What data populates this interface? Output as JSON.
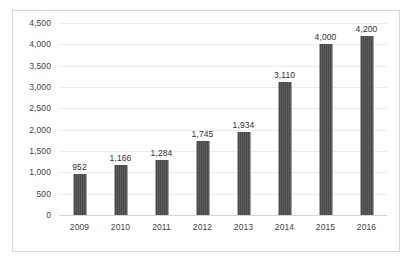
{
  "chart_data": {
    "type": "bar",
    "title": "",
    "subtitle": "",
    "xlabel": "",
    "ylabel": "",
    "categories": [
      "2009",
      "2010",
      "2011",
      "2012",
      "2013",
      "2014",
      "2015",
      "2016"
    ],
    "values": [
      952,
      1166,
      1284,
      1745,
      1934,
      3110,
      4000,
      4200
    ],
    "data_labels": [
      "952",
      "1,166",
      "1,284",
      "1,745",
      "1,934",
      "3,110",
      "4,000",
      "4,200"
    ],
    "ylim": [
      0,
      4500
    ],
    "ytick_values": [
      0,
      500,
      1000,
      1500,
      2000,
      2500,
      3000,
      3500,
      4000,
      4500
    ],
    "ytick_labels": [
      "0",
      "500",
      "1,000",
      "1,500",
      "2,000",
      "2,500",
      "3,000",
      "3,500",
      "4,000",
      "4,500"
    ],
    "grid": true,
    "grid_axis": "y",
    "legend": false,
    "legend_position": "none",
    "series": [
      {
        "name": "",
        "values": [
          952,
          1166,
          1284,
          1745,
          1934,
          3110,
          4000,
          4200
        ],
        "color": "#4a4a4a"
      }
    ]
  },
  "colors": {
    "bar": "#4a4a4a",
    "gridline": "#ececec",
    "baseline": "#d5d5d5",
    "frame_border": "#d8d8d8",
    "axis_text": "#3f3f3f",
    "label_text": "#2f2f2f",
    "background": "#ffffff"
  },
  "caption": {
    "text": ""
  }
}
